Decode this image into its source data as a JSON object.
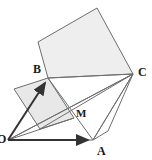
{
  "figure": {
    "background_color": "#ffffff",
    "stroke_color": "#6e6e6e",
    "dark_stroke_color": "#3c3c3c",
    "square_fill": "#eeeeee",
    "square_fill_alt": "#e8e8e8",
    "vector_color": "#333333",
    "label_color": "#1a1a1a",
    "points": {
      "O": {
        "x": 8,
        "y": 140
      },
      "A": {
        "x": 93,
        "y": 140
      },
      "B": {
        "x": 48,
        "y": 78
      },
      "C": {
        "x": 133,
        "y": 74
      },
      "M": {
        "x": 71,
        "y": 107
      },
      "big_square_left": {
        "x": 38,
        "y": 42
      },
      "big_square_top": {
        "x": 97,
        "y": 8
      },
      "small_square_left": {
        "x": 14,
        "y": 89
      },
      "small_square_bottom": {
        "x": 40,
        "y": 129
      },
      "small_square_right": {
        "x": 74,
        "y": 118
      },
      "lower_right_vertex": {
        "x": 108,
        "y": 131
      }
    },
    "labels": [
      {
        "id": "label-B",
        "text": "B",
        "x": 33,
        "y": 63,
        "size": 12
      },
      {
        "id": "label-C",
        "text": "C",
        "x": 138,
        "y": 66,
        "size": 12
      },
      {
        "id": "label-M",
        "text": "M",
        "x": 76,
        "y": 108,
        "size": 11
      },
      {
        "id": "label-A",
        "text": "A",
        "x": 97,
        "y": 145,
        "size": 12
      },
      {
        "id": "label-O",
        "text": "O",
        "x": -3,
        "y": 133,
        "size": 12
      }
    ],
    "shapes": [
      {
        "name": "large-square-on-BC",
        "points": "48,78 38,42 97,8 133,74",
        "filled": true
      },
      {
        "name": "small-square-on-OB",
        "points": "48,78 14,89 40,129 74,118",
        "filled": true
      },
      {
        "name": "triangle-O-A-C",
        "points": "8,140 93,140 133,74",
        "filled": false
      },
      {
        "name": "triangle-B-C-A",
        "points": "48,78 133,74 93,140",
        "filled": false
      },
      {
        "name": "triangle-C-A-lowerright",
        "points": "133,74 93,140 108,131",
        "filled": false
      }
    ],
    "segments": [
      {
        "name": "segment-O-C",
        "x1": 8,
        "y1": 140,
        "x2": 133,
        "y2": 74
      },
      {
        "name": "segment-B-C",
        "x1": 48,
        "y1": 78,
        "x2": 133,
        "y2": 74
      },
      {
        "name": "segment-C-A",
        "x1": 133,
        "y1": 74,
        "x2": 93,
        "y2": 140
      },
      {
        "name": "segment-C-lowerleft",
        "x1": 133,
        "y1": 74,
        "x2": 40,
        "y2": 129
      },
      {
        "name": "segment-O-smallsquare-right",
        "x1": 8,
        "y1": 140,
        "x2": 74,
        "y2": 118
      },
      {
        "name": "segment-B-A",
        "x1": 48,
        "y1": 78,
        "x2": 93,
        "y2": 140
      }
    ],
    "vectors": [
      {
        "name": "vector-O-to-A",
        "x1": 8,
        "y1": 140,
        "x2": 93,
        "y2": 140
      },
      {
        "name": "vector-O-to-B",
        "x1": 8,
        "y1": 140,
        "x2": 48,
        "y2": 78
      }
    ]
  }
}
